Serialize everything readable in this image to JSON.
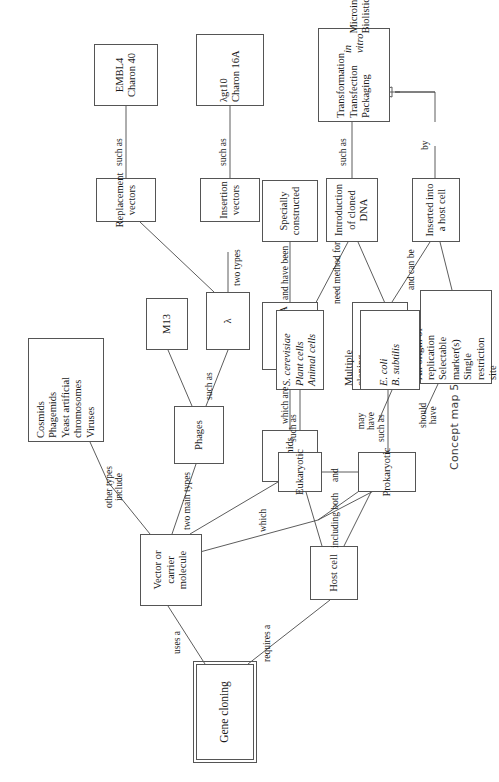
{
  "caption": "Concept map 5",
  "root": {
    "label": "Gene cloning"
  },
  "nodes": {
    "vector": "Vector or\ncarrier molecule",
    "other_types": "Cosmids\nPhagemids\nYeast artificial\nchromosomes\nViruses",
    "phages": "Phages",
    "m13": "M13",
    "lambda": "λ",
    "replacement_vectors": "Replacement\nvectors",
    "replacement_examples": "EMBL4\nCharon 40",
    "insertion_vectors": "Insertion\nvectors",
    "insertion_examples": "λgt10\nCharon 16A",
    "plasmids": "Plasmids",
    "circular_dna": "Circular DNA\nmolecules",
    "specially_constructed": "Specially\nconstructed",
    "may_have_features": "Multiple\ncloning\nsite\n\nExpression\nsignals",
    "should_have_features": "An origin of\nreplication\nSelectable\nmarker(s)\nSingle\nrestriction\nsite",
    "inserted_host": "Inserted into\na host cell",
    "host_cell": "Host cell",
    "eukaryotic": "Eukaryotic",
    "prokaryotic": "Prokaryotic",
    "eukaryotic_examples": "S. cerevisiae\nPlant cells\nAnimal cells",
    "prokaryotic_examples": "E. coli\nB. subtilis",
    "introduction_dna": "Introduction\nof cloned\nDNA",
    "methods": "Transformation\nTransfection\nPackaging in vitro\nMicroinjection\nBiolistics"
  },
  "link_labels": {
    "uses_a": "uses a",
    "requires_a": "requires a",
    "other_types_include": "other types\ninclude",
    "two_main_types": "two main types",
    "which": "which",
    "such_as_phages": "such as",
    "two_types": "two types",
    "such_as_replacement": "such as",
    "such_as_insertion": "such as",
    "which_are": "which are",
    "and_have_been": "and have been",
    "may_have": "may\nhave",
    "should_have": "should\nhave",
    "and_can_be": "and can be",
    "by": "by",
    "including_both": "including both",
    "and": "and",
    "such_as_euk": "such as",
    "such_as_prok": "such as",
    "need_method_for": "need method for",
    "such_as_methods": "such as"
  }
}
